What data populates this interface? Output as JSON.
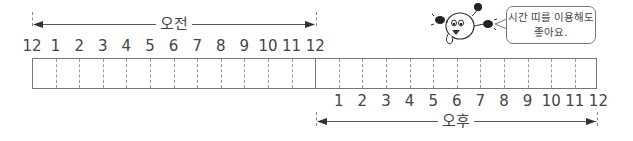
{
  "am_label": "오전",
  "pm_label": "오후",
  "am_hours": [
    "12",
    "1",
    "2",
    "3",
    "4",
    "5",
    "6",
    "7",
    "8",
    "9",
    "10",
    "11",
    "12"
  ],
  "pm_hours": [
    "1",
    "2",
    "3",
    "4",
    "5",
    "6",
    "7",
    "8",
    "9",
    "10",
    "11",
    "12"
  ],
  "speech_bubble": {
    "line1": "시간 띠를 이용해도",
    "line2": "좋아요."
  },
  "character_icon": "cartoon-mascot-icon"
}
